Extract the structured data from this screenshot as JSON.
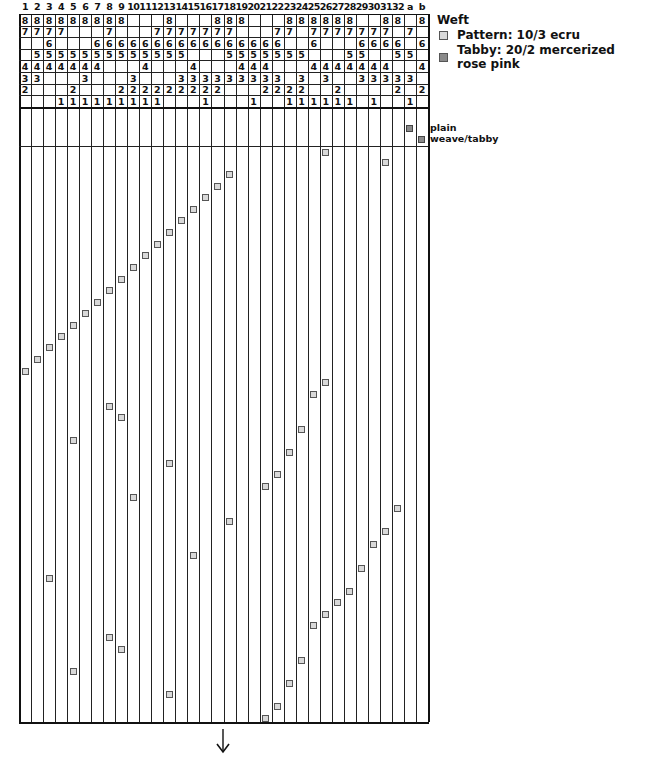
{
  "draft": {
    "grid": {
      "left": 19,
      "right": 428,
      "tie_top": 14,
      "tie_row_h": 11.6,
      "tie_bottom": 123,
      "tabby_bottom": 146,
      "bottom": 722
    },
    "columns": [
      "1",
      "2",
      "3",
      "4",
      "5",
      "6",
      "7",
      "8",
      "9",
      "10",
      "11",
      "12",
      "13",
      "14",
      "15",
      "16",
      "17",
      "18",
      "19",
      "20",
      "21",
      "22",
      "23",
      "24",
      "25",
      "26",
      "27",
      "28",
      "29",
      "30",
      "31",
      "32",
      "a",
      "b"
    ],
    "tieup_rows": [
      "8",
      "7",
      "6",
      "5",
      "4",
      "3",
      "2",
      "1"
    ],
    "tieup": {
      "1": [
        "8",
        "7",
        "",
        "",
        "4",
        "3",
        "2",
        ""
      ],
      "2": [
        "8",
        "7",
        "",
        "5",
        "4",
        "3",
        "",
        ""
      ],
      "3": [
        "8",
        "7",
        "6",
        "5",
        "4",
        "",
        "",
        ""
      ],
      "4": [
        "8",
        "7",
        "",
        "5",
        "4",
        "",
        "",
        "1"
      ],
      "5": [
        "8",
        "",
        "",
        "5",
        "4",
        "",
        "2",
        "1"
      ],
      "6": [
        "8",
        "",
        "",
        "5",
        "4",
        "3",
        "",
        "1"
      ],
      "7": [
        "8",
        "",
        "6",
        "5",
        "4",
        "",
        "",
        "1"
      ],
      "8": [
        "8",
        "7",
        "6",
        "5",
        "",
        "",
        "",
        "1"
      ],
      "9": [
        "8",
        "",
        "6",
        "5",
        "",
        "",
        "2",
        "1"
      ],
      "10": [
        "",
        "",
        "6",
        "5",
        "",
        "3",
        "2",
        "1"
      ],
      "11": [
        "",
        "",
        "6",
        "5",
        "4",
        "",
        "2",
        "1"
      ],
      "12": [
        "",
        "7",
        "6",
        "5",
        "",
        "",
        "2",
        "1"
      ],
      "13": [
        "8",
        "7",
        "6",
        "5",
        "",
        "",
        "2",
        ""
      ],
      "14": [
        "",
        "7",
        "6",
        "5",
        "",
        "3",
        "2",
        ""
      ],
      "15": [
        "",
        "7",
        "6",
        "",
        "4",
        "3",
        "2",
        ""
      ],
      "16": [
        "",
        "7",
        "6",
        "",
        "",
        "3",
        "2",
        "1"
      ],
      "17": [
        "8",
        "7",
        "6",
        "",
        "",
        "3",
        "2",
        ""
      ],
      "18": [
        "8",
        "7",
        "6",
        "5",
        "",
        "3",
        "",
        ""
      ],
      "19": [
        "8",
        "",
        "6",
        "5",
        "4",
        "3",
        "",
        ""
      ],
      "20": [
        "",
        "",
        "6",
        "5",
        "4",
        "3",
        "",
        "1"
      ],
      "21": [
        "",
        "",
        "6",
        "5",
        "4",
        "3",
        "2",
        ""
      ],
      "22": [
        "",
        "7",
        "6",
        "5",
        "",
        "3",
        "2",
        ""
      ],
      "23": [
        "8",
        "7",
        "",
        "5",
        "",
        "",
        "2",
        "1"
      ],
      "24": [
        "8",
        "",
        "",
        "5",
        "",
        "3",
        "2",
        "1"
      ],
      "25": [
        "8",
        "7",
        "6",
        "",
        "4",
        "",
        "",
        "1"
      ],
      "26": [
        "8",
        "7",
        "",
        "",
        "4",
        "3",
        "",
        "1"
      ],
      "27": [
        "8",
        "7",
        "",
        "",
        "4",
        "",
        "2",
        "1"
      ],
      "28": [
        "8",
        "7",
        "",
        "5",
        "4",
        "",
        "",
        "1"
      ],
      "29": [
        "",
        "7",
        "6",
        "5",
        "4",
        "3",
        "",
        ""
      ],
      "30": [
        "",
        "7",
        "6",
        "",
        "4",
        "3",
        "",
        "1"
      ],
      "31": [
        "8",
        "7",
        "6",
        "",
        "4",
        "3",
        "",
        ""
      ],
      "32": [
        "8",
        "",
        "6",
        "5",
        "",
        "3",
        "2",
        ""
      ],
      "a": [
        "",
        "7",
        "",
        "5",
        "",
        "3",
        "",
        "1"
      ],
      "b": [
        "8",
        "",
        "6",
        "",
        "4",
        "",
        "2",
        ""
      ]
    },
    "tabby_marks": [
      {
        "col": "a",
        "y": 128
      },
      {
        "col": "b",
        "y": 139
      }
    ],
    "tabby_label": [
      "plain",
      "weave/tabby"
    ],
    "pattern_marks": [
      {
        "col": "26",
        "y": 152
      },
      {
        "col": "31",
        "y": 162
      },
      {
        "col": "18",
        "y": 174
      },
      {
        "col": "17",
        "y": 186
      },
      {
        "col": "16",
        "y": 197
      },
      {
        "col": "15",
        "y": 209
      },
      {
        "col": "14",
        "y": 220
      },
      {
        "col": "13",
        "y": 232
      },
      {
        "col": "12",
        "y": 244
      },
      {
        "col": "11",
        "y": 255
      },
      {
        "col": "10",
        "y": 267
      },
      {
        "col": "9",
        "y": 279
      },
      {
        "col": "8",
        "y": 290
      },
      {
        "col": "7",
        "y": 302
      },
      {
        "col": "6",
        "y": 313
      },
      {
        "col": "5",
        "y": 325
      },
      {
        "col": "4",
        "y": 336
      },
      {
        "col": "3",
        "y": 347
      },
      {
        "col": "2",
        "y": 359
      },
      {
        "col": "1",
        "y": 371
      },
      {
        "col": "26",
        "y": 382
      },
      {
        "col": "25",
        "y": 394
      },
      {
        "col": "8",
        "y": 406
      },
      {
        "col": "9",
        "y": 417
      },
      {
        "col": "24",
        "y": 429
      },
      {
        "col": "5",
        "y": 440
      },
      {
        "col": "23",
        "y": 452
      },
      {
        "col": "13",
        "y": 463
      },
      {
        "col": "22",
        "y": 474
      },
      {
        "col": "21",
        "y": 486
      },
      {
        "col": "10",
        "y": 497
      },
      {
        "col": "32",
        "y": 508
      },
      {
        "col": "18",
        "y": 521
      },
      {
        "col": "31",
        "y": 531
      },
      {
        "col": "30",
        "y": 544
      },
      {
        "col": "15",
        "y": 555
      },
      {
        "col": "29",
        "y": 568
      },
      {
        "col": "3",
        "y": 578
      },
      {
        "col": "28",
        "y": 591
      },
      {
        "col": "27",
        "y": 602
      },
      {
        "col": "26",
        "y": 614
      },
      {
        "col": "25",
        "y": 625
      },
      {
        "col": "8",
        "y": 637
      },
      {
        "col": "9",
        "y": 649
      },
      {
        "col": "24",
        "y": 660
      },
      {
        "col": "5",
        "y": 671
      },
      {
        "col": "23",
        "y": 683
      },
      {
        "col": "13",
        "y": 694
      },
      {
        "col": "22",
        "y": 706
      },
      {
        "col": "21",
        "y": 718
      }
    ],
    "direction_icon": "arrow-down-icon"
  },
  "legend": {
    "title": "Weft",
    "items": [
      {
        "label": "Pattern:  10/3 ecru",
        "color": "#d9d9d9"
      },
      {
        "label": "Tabby:  20/2 mercerized rose pink",
        "color": "#8a8a8a"
      }
    ]
  }
}
